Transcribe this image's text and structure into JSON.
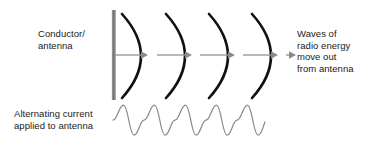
{
  "diagram": {
    "background_color": "#ffffff",
    "width": 372,
    "height": 147
  },
  "labels": {
    "conductor": {
      "line1": "Conductor/",
      "line2": "antenna"
    },
    "waves": {
      "line1": "Waves of",
      "line2": "radio energy",
      "line3": "move out",
      "line4": "from antenna"
    },
    "alternating": {
      "line1": "Alternating current",
      "line2": "applied to antenna"
    }
  },
  "colors": {
    "text": "#1a1a1a",
    "antenna_bar": "#808080",
    "wavefront_arc": "#111111",
    "arrow_line": "#9a9a9a",
    "arrow_head": "#8a8a8a",
    "sine_wave": "#8a8a8a"
  },
  "graphics": {
    "antenna_bar": {
      "x": 113.5,
      "y_top": 10,
      "y_bottom": 100,
      "width": 4
    },
    "wavefront_arcs": {
      "count": 4,
      "crest_x": [
        148,
        192,
        235,
        278
      ],
      "y_top": 14,
      "y_bottom": 98,
      "bulge": -26,
      "stroke_width": 2.6
    },
    "propagation_line": {
      "y": 55,
      "x_start": 113,
      "x_end": 288,
      "stroke_width": 1.4
    },
    "propagation_arrowheads": {
      "count": 5,
      "tip_x": [
        140,
        184,
        227,
        270,
        288
      ],
      "size": 5
    },
    "sine_wave": {
      "cycles": 4,
      "x_start": 113,
      "x_end": 265,
      "y_center": 120,
      "amplitude": 15,
      "stroke_width": 1.2,
      "phase": "rising-from-zero"
    }
  }
}
